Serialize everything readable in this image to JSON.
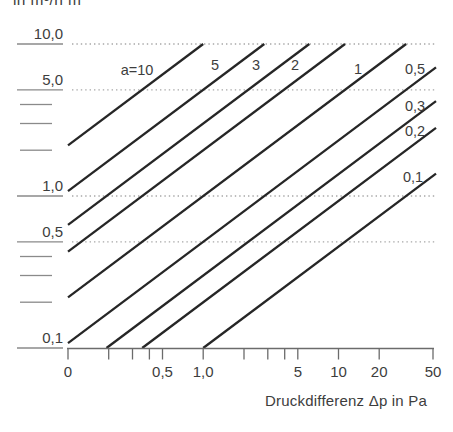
{
  "titles": {
    "y_axis_unit": "in m³/h m",
    "x_axis_title": "Druckdifferenz Δp in Pa"
  },
  "colors": {
    "background": "#ffffff",
    "series_line": "#262626",
    "grid_dots": "#a8a8a8",
    "axis": "#6b6b6b",
    "y_dash": "#8a8a8a",
    "text": "#3d3d3d"
  },
  "chart_data": {
    "type": "line",
    "scale": "log-log",
    "relation": "V = a · Δp^(2/3)",
    "exponent": 0.6666667,
    "xlabel": "Druckdifferenz Δp in Pa",
    "ylabel": "in m³/h m",
    "xlim": [
      0.1,
      50
    ],
    "ylim": [
      0.1,
      10
    ],
    "grid": "dotted horizontal at y = 10, 5, 1, 0.5",
    "gridlines_y": [
      10,
      5,
      1,
      0.5
    ],
    "x_ticks": [
      {
        "v": 0.1,
        "label": "0"
      },
      {
        "v": 0.2,
        "label": ""
      },
      {
        "v": 0.3,
        "label": ""
      },
      {
        "v": 0.4,
        "label": ""
      },
      {
        "v": 0.5,
        "label": "0,5"
      },
      {
        "v": 1,
        "label": "1,0"
      },
      {
        "v": 2,
        "label": ""
      },
      {
        "v": 3,
        "label": ""
      },
      {
        "v": 4,
        "label": ""
      },
      {
        "v": 5,
        "label": "5"
      },
      {
        "v": 10,
        "label": "10"
      },
      {
        "v": 20,
        "label": "20"
      },
      {
        "v": 50,
        "label": "50"
      }
    ],
    "y_major_ticks": [
      {
        "v": 10,
        "label": "10,0"
      },
      {
        "v": 5,
        "label": "5,0"
      },
      {
        "v": 1,
        "label": "1,0"
      },
      {
        "v": 0.5,
        "label": "0,5"
      },
      {
        "v": 0.1,
        "label": "0,1"
      }
    ],
    "y_minor_ticks": [
      4,
      3,
      2,
      0.4,
      0.3,
      0.2
    ],
    "series": [
      {
        "a": 10,
        "label": "a=10",
        "label_pos": [
          137,
          75
        ]
      },
      {
        "a": 5,
        "label": "5",
        "label_pos": [
          215,
          70
        ]
      },
      {
        "a": 3,
        "label": "3",
        "label_pos": [
          256,
          70
        ]
      },
      {
        "a": 2,
        "label": "2",
        "label_pos": [
          295,
          70
        ]
      },
      {
        "a": 1,
        "label": "1",
        "label_pos": [
          358,
          74
        ]
      },
      {
        "a": 0.5,
        "label": "0,5",
        "label_pos": [
          415,
          74
        ]
      },
      {
        "a": 0.3,
        "label": "0,3",
        "label_pos": [
          415,
          111
        ]
      },
      {
        "a": 0.2,
        "label": "0,2",
        "label_pos": [
          415,
          136
        ]
      },
      {
        "a": 0.1,
        "label": "0,1",
        "label_pos": [
          413,
          182
        ]
      }
    ]
  }
}
